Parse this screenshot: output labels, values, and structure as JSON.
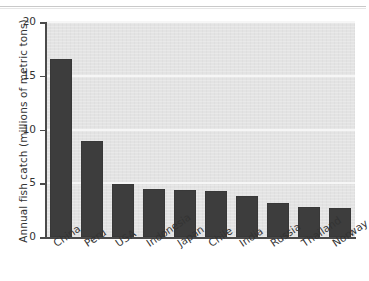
{
  "chart_data": {
    "type": "bar",
    "title": "",
    "subtitle": "",
    "xlabel": "",
    "ylabel": "Annual fish catch (millions of metric tons)",
    "categories": [
      "China",
      "Peru",
      "USA",
      "Indonesia",
      "Japan",
      "Chile",
      "India",
      "Russia",
      "Thailand",
      "Norway"
    ],
    "values": [
      16.6,
      8.9,
      4.9,
      4.5,
      4.4,
      4.3,
      3.8,
      3.2,
      2.8,
      2.7
    ],
    "ylim": [
      0,
      20
    ],
    "yticks": [
      0,
      5,
      10,
      15,
      20
    ],
    "ytick_labels": [
      "0",
      "5",
      "10",
      "15",
      "20"
    ],
    "grid": "horizontal",
    "legend": "none",
    "bar_color": "#3d3d3d",
    "plot_background": "#e3e3e3",
    "gridline_color": "#f6f6f6",
    "axis_color": "#4a4a4a",
    "annotations": []
  }
}
